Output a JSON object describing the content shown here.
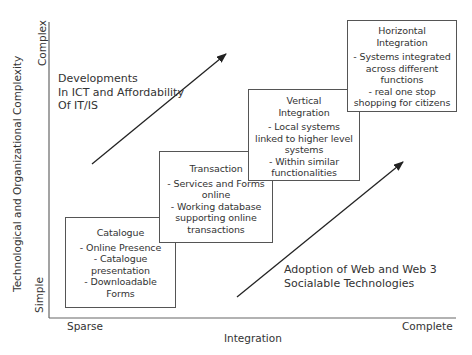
{
  "y_axis": {
    "label": "Technological and Organizational Complexity",
    "low": "Simple",
    "high": "Complex"
  },
  "x_axis": {
    "label": "Integration",
    "low": "Sparse",
    "high": "Complete"
  },
  "stages": [
    {
      "title": "Catalogue",
      "items": [
        "- Online Presence",
        "- Catalogue",
        "presentation",
        "- Downloadable",
        "Forms"
      ]
    },
    {
      "title": "Transaction",
      "items": [
        "- Services and Forms",
        "online",
        "- Working database",
        "supporting online",
        "transactions"
      ]
    },
    {
      "title_lines": [
        "Vertical",
        "Integration"
      ],
      "items": [
        "- Local systems",
        "linked to higher level",
        "systems",
        "- Within similar",
        "functionalities"
      ]
    },
    {
      "title_lines": [
        "Horizontal",
        "Integration"
      ],
      "items": [
        "- Systems integrated",
        "across different",
        "functions",
        "- real one stop",
        "shopping for citizens"
      ]
    }
  ],
  "annotations": {
    "upper": [
      "Developments",
      "In ICT and Affordability",
      "Of IT/IS"
    ],
    "lower": [
      "Adoption of Web and Web 3",
      "Socialable Technologies"
    ]
  },
  "colors": {
    "line": "#333333",
    "axis": "#666666",
    "box_border": "#555555",
    "text": "#333333"
  }
}
